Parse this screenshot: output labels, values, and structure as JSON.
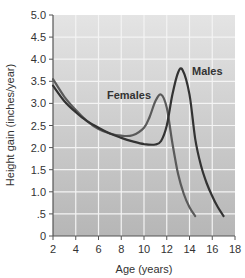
{
  "chart_data": {
    "type": "line",
    "title": "",
    "xlabel": "Age (years)",
    "ylabel": "Height gain (inches/year)",
    "xlim": [
      2,
      18
    ],
    "ylim": [
      0,
      5.0
    ],
    "grid": true,
    "legend_position": "inline labels",
    "x_ticks": [
      "2",
      "4",
      "6",
      "8",
      "10",
      "12",
      "14",
      "16",
      "18"
    ],
    "y_ticks": [
      "0",
      ".5",
      "1.0",
      "1.5",
      "2.0",
      "2.5",
      "3.0",
      "3.5",
      "4.0",
      "4.5",
      "5.0"
    ],
    "series": [
      {
        "name": "Females",
        "color": "#5a5a5a",
        "x": [
          2,
          3,
          4,
          5,
          6,
          7,
          8,
          9,
          10,
          10.5,
          11,
          11.5,
          12,
          12.5,
          13,
          13.5,
          14,
          14.5
        ],
        "values": [
          3.55,
          3.15,
          2.85,
          2.6,
          2.42,
          2.32,
          2.27,
          2.28,
          2.45,
          2.7,
          3.05,
          3.2,
          2.9,
          2.1,
          1.4,
          0.95,
          0.65,
          0.45
        ]
      },
      {
        "name": "Males",
        "color": "#333333",
        "x": [
          2,
          3,
          4,
          5,
          6,
          7,
          8,
          9,
          10,
          11,
          11.5,
          12,
          12.5,
          13,
          13.4,
          14,
          14.5,
          15,
          15.5,
          16,
          16.5,
          17
        ],
        "values": [
          3.4,
          3.05,
          2.8,
          2.6,
          2.45,
          2.32,
          2.22,
          2.14,
          2.08,
          2.07,
          2.15,
          2.5,
          3.2,
          3.7,
          3.75,
          3.2,
          2.2,
          1.6,
          1.2,
          0.9,
          0.65,
          0.45
        ]
      }
    ],
    "annotations": [
      "Females",
      "Males"
    ]
  },
  "labels": {
    "xlabel": "Age (years)",
    "ylabel": "Height gain (inches/year)",
    "females": "Females",
    "males": "Males"
  }
}
